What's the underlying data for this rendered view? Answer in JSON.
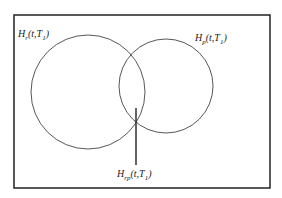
{
  "diagram": {
    "type": "venn",
    "sets": [
      {
        "id": "r",
        "label_main": "H",
        "label_sub": "r",
        "label_args_pre": "(t,T",
        "label_args_sub": "1",
        "label_args_post": ")"
      },
      {
        "id": "p",
        "label_main": "H",
        "label_sub": "p",
        "label_args_pre": "(t,T",
        "label_args_sub": "1",
        "label_args_post": ")"
      }
    ],
    "intersection": {
      "label_main": "H",
      "label_sub": "rp",
      "label_args_pre": "(t,T",
      "label_args_sub": "1",
      "label_args_post": ")"
    },
    "colors": {
      "stroke": "#333333",
      "frame": "#222222",
      "background": "#ffffff"
    }
  }
}
